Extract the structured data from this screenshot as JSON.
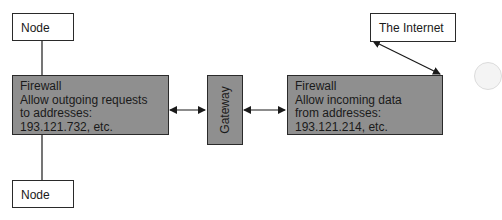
{
  "diagram": {
    "nodes": {
      "node_top": {
        "label": "Node"
      },
      "node_bottom": {
        "label": "Node"
      },
      "firewall_left": {
        "lines": [
          "Firewall",
          "Allow outgoing requests",
          "to addresses:",
          "193.121.732, etc."
        ]
      },
      "gateway": {
        "label": "Gateway"
      },
      "firewall_right": {
        "lines": [
          "Firewall",
          "Allow incoming data",
          "from addresses:",
          "193.121.214, etc."
        ]
      },
      "internet": {
        "label": "The Internet"
      }
    },
    "edges": [
      {
        "from": "node_top",
        "to": "firewall_left",
        "type": "line"
      },
      {
        "from": "firewall_left",
        "to": "node_bottom",
        "type": "line"
      },
      {
        "from": "firewall_left",
        "to": "gateway",
        "type": "bidirectional-arrow"
      },
      {
        "from": "gateway",
        "to": "firewall_right",
        "type": "bidirectional-arrow"
      },
      {
        "from": "firewall_right",
        "to": "internet",
        "type": "bidirectional-arrow"
      }
    ],
    "colors": {
      "box_fill": "#8f8f8f",
      "border": "#2a2a2a",
      "background": "#ffffff"
    }
  }
}
